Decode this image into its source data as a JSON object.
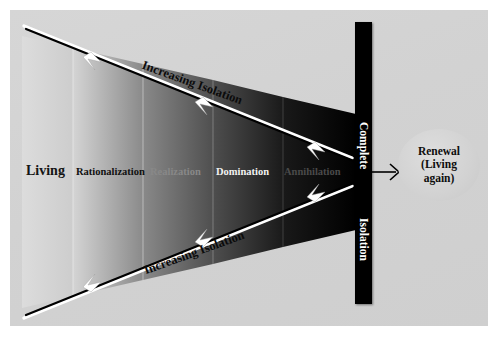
{
  "diagram": {
    "panel_background": "#d3d3d3",
    "bands": [
      {
        "id": "living",
        "label": "Living",
        "text_color": "#141414",
        "fill_start": "#d8d8d8",
        "fill_end": "#cfcfcf"
      },
      {
        "id": "rationalization",
        "label": "Rationalization",
        "text_color": "#111111",
        "fill_start": "#d0d0d0",
        "fill_end": "#8c8c8c"
      },
      {
        "id": "realization",
        "label": "Realization",
        "text_color": "#888888",
        "fill_start": "#8a8a8a",
        "fill_end": "#555555"
      },
      {
        "id": "domination",
        "label": "Domination",
        "text_color": "#f2f2f2",
        "fill_start": "#545454",
        "fill_end": "#1e1e1e"
      },
      {
        "id": "annihilation",
        "label": "Annihilation",
        "text_color": "#4a4a4a",
        "fill_start": "#1c1c1c",
        "fill_end": "#000000"
      }
    ],
    "arrows": {
      "top_label": "Increasing Isolation",
      "bottom_label": "Increasing Isolation",
      "line_color": "#000000",
      "highlight_color": "#ffffff"
    },
    "isolation_bar": {
      "line_one": "Complete",
      "line_two": "Isolation",
      "fill": "#000000",
      "text_color": "#ffffff"
    },
    "outcome": {
      "line_one": "Renewal",
      "line_two": "(Living",
      "line_three": "again)",
      "shape": "ellipse",
      "fill": "#d2d2d2",
      "text_color": "#0d0d0d"
    },
    "connector": {
      "from": "isolation-bar",
      "to": "renewal-ellipse",
      "color": "#000000"
    }
  }
}
